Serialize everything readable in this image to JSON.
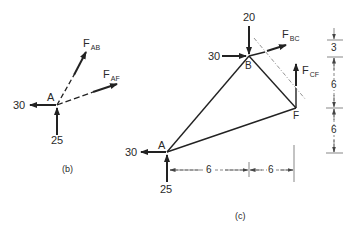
{
  "figure_b": {
    "caption": "(b)",
    "joint": "A",
    "loads": {
      "horizontal": "30",
      "vertical": "25"
    },
    "forces": [
      {
        "name": "F",
        "sub": "AB"
      },
      {
        "name": "F",
        "sub": "AF"
      }
    ]
  },
  "figure_c": {
    "caption": "(c)",
    "joints": {
      "A": "A",
      "B": "B",
      "F": "F"
    },
    "loads": {
      "B_vertical": "20",
      "B_horizontal": "30",
      "A_horizontal": "30",
      "A_vertical": "25"
    },
    "forces": [
      {
        "name": "F",
        "sub": "BC"
      },
      {
        "name": "F",
        "sub": "CF"
      }
    ],
    "horizontal_dims": [
      "6",
      "6"
    ],
    "vertical_dims": [
      "3",
      "6",
      "6"
    ]
  },
  "colors": {
    "ink": "#2a2a2a",
    "dim": "#555555",
    "background": "#ffffff"
  }
}
